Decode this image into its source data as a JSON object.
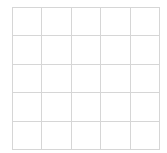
{
  "grid": {
    "rows": 5,
    "columns": 5,
    "line_color": "#d6d6d6",
    "background_color": "#ffffff"
  }
}
